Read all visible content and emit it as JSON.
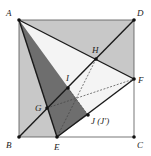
{
  "diagram": {
    "type": "geometry-square-fold",
    "colors": {
      "light_gray": "#c8c8c8",
      "dark_gray": "#6e6e6e",
      "white": "#ffffff",
      "line": "#1a1a1a",
      "thin": "#555555"
    },
    "points": {
      "A": {
        "label": "A",
        "x": 19,
        "y": 20,
        "lx": 6,
        "ly": 16
      },
      "D": {
        "label": "D",
        "x": 134,
        "y": 20,
        "lx": 137,
        "ly": 16
      },
      "B": {
        "label": "B",
        "x": 19,
        "y": 137,
        "lx": 6,
        "ly": 148
      },
      "C": {
        "label": "C",
        "x": 134,
        "y": 137,
        "lx": 137,
        "ly": 148
      },
      "E": {
        "label": "E",
        "x": 57,
        "y": 137,
        "lx": 54,
        "ly": 150
      },
      "F": {
        "label": "F",
        "x": 134,
        "y": 79,
        "lx": 138,
        "ly": 83
      },
      "H": {
        "label": "H",
        "x": 96,
        "y": 59,
        "lx": 92,
        "ly": 53
      },
      "I": {
        "label": "I",
        "x": 68,
        "y": 88,
        "lx": 66,
        "ly": 81
      },
      "G": {
        "label": "G",
        "x": 47,
        "y": 108,
        "lx": 35,
        "ly": 111
      },
      "J": {
        "label": "J (J′)",
        "x": 88,
        "y": 115,
        "lx": 91,
        "ly": 124
      }
    }
  }
}
